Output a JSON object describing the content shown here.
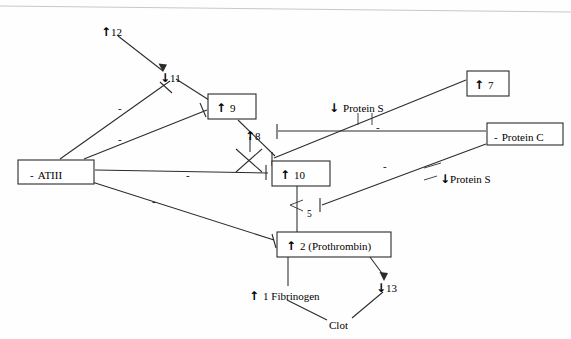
{
  "figure": {
    "type": "diagram",
    "width": 571,
    "height": 339,
    "background": "#fefefe",
    "stroke_color": "#2b2b2b",
    "text_color": "#1a1a1a"
  },
  "nodes": [
    {
      "id": "f12",
      "label": "12",
      "arrow": "↑",
      "boxed": false,
      "x": 104,
      "y": 28,
      "w": 0,
      "h": 0
    },
    {
      "id": "f11",
      "label": "11",
      "arrow": "↓",
      "boxed": false,
      "x": 163,
      "y": 76,
      "w": 0,
      "h": 0
    },
    {
      "id": "f9",
      "label": "9",
      "arrow": "↑",
      "boxed": true,
      "x": 208,
      "y": 94,
      "w": 48,
      "h": 25
    },
    {
      "id": "f8",
      "label": "8",
      "arrow": "↑",
      "boxed": false,
      "x": 250,
      "y": 133,
      "w": 0,
      "h": 0
    },
    {
      "id": "f10",
      "label": "10",
      "arrow": "↑",
      "boxed": true,
      "x": 272,
      "y": 161,
      "w": 58,
      "h": 25
    },
    {
      "id": "f7",
      "label": "7",
      "arrow": "↑",
      "boxed": true,
      "x": 467,
      "y": 71,
      "w": 42,
      "h": 25
    },
    {
      "id": "atiii",
      "label": "ATIII",
      "arrow": "-",
      "boxed": true,
      "x": 18,
      "y": 160,
      "w": 76,
      "h": 24
    },
    {
      "id": "proteinc",
      "label": "Protein C",
      "arrow": "-",
      "boxed": true,
      "x": 487,
      "y": 123,
      "w": 76,
      "h": 22
    },
    {
      "id": "proteins1",
      "label": "Protein S",
      "arrow": "↓",
      "boxed": false,
      "x": 332,
      "y": 104,
      "w": 0,
      "h": 0
    },
    {
      "id": "proteins2",
      "label": "Protein S",
      "arrow": "↓",
      "boxed": false,
      "x": 443,
      "y": 175,
      "w": 0,
      "h": 0
    },
    {
      "id": "f5",
      "label": "5",
      "arrow": "",
      "boxed": false,
      "x": 309,
      "y": 210,
      "w": 0,
      "h": 0
    },
    {
      "id": "prothrombin",
      "label": "2 (Prothrombin)",
      "arrow": "↑",
      "boxed": true,
      "x": 277,
      "y": 232,
      "w": 114,
      "h": 25
    },
    {
      "id": "fibrinogen",
      "label": "1 Fibrinogen",
      "arrow": "↑",
      "boxed": false,
      "x": 251,
      "y": 293,
      "w": 0,
      "h": 0
    },
    {
      "id": "f13",
      "label": "13",
      "arrow": "↓",
      "boxed": false,
      "x": 379,
      "y": 285,
      "w": 0,
      "h": 0
    },
    {
      "id": "clot",
      "label": "Clot",
      "arrow": "",
      "boxed": false,
      "x": 331,
      "y": 322,
      "w": 0,
      "h": 0
    }
  ],
  "edge_labels": [
    {
      "id": "minus-atiii-11",
      "text": "-",
      "x": 120,
      "y": 108
    },
    {
      "id": "minus-atiii-9",
      "text": "-",
      "x": 120,
      "y": 139
    },
    {
      "id": "minus-atiii-10",
      "text": "-",
      "x": 188,
      "y": 175
    },
    {
      "id": "minus-atiii-2",
      "text": "-",
      "x": 154,
      "y": 201
    },
    {
      "id": "minus-pc-10",
      "text": "-",
      "x": 385,
      "y": 166
    },
    {
      "id": "minus-pc-7",
      "text": "-",
      "x": 378,
      "y": 127
    }
  ],
  "edges": [
    {
      "id": "e-12-11",
      "from": "f12",
      "to": "f11",
      "kind": "activate"
    },
    {
      "id": "e-11-9",
      "from": "f11",
      "to": "f9",
      "kind": "activate"
    },
    {
      "id": "e-9-10",
      "from": "f9",
      "to": "f10",
      "kind": "activate"
    },
    {
      "id": "e-8-10",
      "from": "f8",
      "to": "f10",
      "kind": "cofactor"
    },
    {
      "id": "e-7-10",
      "from": "f7",
      "to": "f10",
      "kind": "activate"
    },
    {
      "id": "e-10-2",
      "from": "f10",
      "to": "prothrombin",
      "kind": "activate"
    },
    {
      "id": "e-2-1",
      "from": "prothrombin",
      "to": "fibrinogen",
      "kind": "activate"
    },
    {
      "id": "e-2-13",
      "from": "prothrombin",
      "to": "f13",
      "kind": "activate"
    },
    {
      "id": "e-1-clot",
      "from": "fibrinogen",
      "to": "clot",
      "kind": "activate"
    },
    {
      "id": "e-13-clot",
      "from": "f13",
      "to": "clot",
      "kind": "activate"
    },
    {
      "id": "e-atiii-11",
      "from": "atiii",
      "to": "f11",
      "kind": "inhibit"
    },
    {
      "id": "e-atiii-9",
      "from": "atiii",
      "to": "f9",
      "kind": "inhibit"
    },
    {
      "id": "e-atiii-10",
      "from": "atiii",
      "to": "f10",
      "kind": "inhibit"
    },
    {
      "id": "e-atiii-2",
      "from": "atiii",
      "to": "prothrombin",
      "kind": "inhibit"
    },
    {
      "id": "e-pc-8",
      "from": "proteinc",
      "to": "f8",
      "kind": "inhibit"
    },
    {
      "id": "e-pc-5",
      "from": "proteinc",
      "to": "f5",
      "kind": "inhibit"
    }
  ],
  "glyphs": {
    "up": "↑",
    "down": "↓",
    "minus": "-"
  }
}
